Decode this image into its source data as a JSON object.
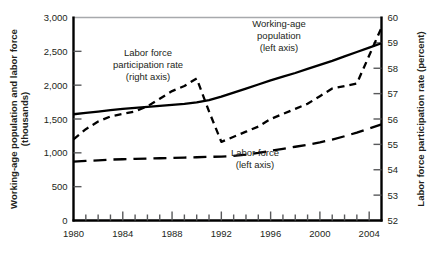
{
  "chart_data": {
    "type": "line",
    "title": "",
    "xlabel": "",
    "ylabel": "Working-age population and labor force (thousands)",
    "y2label": "Labor force participation rate (percent)",
    "x": [
      1980,
      1981,
      1982,
      1983,
      1984,
      1985,
      1986,
      1987,
      1988,
      1989,
      1990,
      1991,
      1992,
      1993,
      1994,
      1995,
      1996,
      1997,
      1998,
      1999,
      2000,
      2001,
      2002,
      2003,
      2004,
      2005
    ],
    "xlim": [
      1980,
      2005
    ],
    "xticks": [
      1980,
      1981,
      1982,
      1983,
      1984,
      1985,
      1986,
      1987,
      1988,
      1989,
      1990,
      1991,
      1992,
      1993,
      1994,
      1995,
      1996,
      1997,
      1998,
      1999,
      2000,
      2001,
      2002,
      2003,
      2004,
      2005
    ],
    "xtick_labels": [
      "1980",
      "",
      "",
      "",
      "1984",
      "",
      "",
      "",
      "1988",
      "",
      "",
      "",
      "1992",
      "",
      "",
      "",
      "1996",
      "",
      "",
      "",
      "2000",
      "",
      "",
      "",
      "2004",
      ""
    ],
    "ylim": [
      0,
      3000
    ],
    "yticks": [
      0,
      500,
      1000,
      1500,
      2000,
      2500,
      3000
    ],
    "ytick_labels": [
      "0",
      "500",
      "1,000",
      "1,500",
      "2,000",
      "2,500",
      "3,000"
    ],
    "y2lim": [
      52,
      60
    ],
    "y2ticks": [
      52,
      53,
      54,
      55,
      56,
      57,
      58,
      59,
      60
    ],
    "y2tick_labels": [
      "52",
      "53",
      "54",
      "55",
      "56",
      "57",
      "58",
      "59",
      "60"
    ],
    "grid": false,
    "legend_position": "inline-annotations",
    "series": [
      {
        "name": "Working-age population (left axis)",
        "axis": "left",
        "style": "solid",
        "color": "#000000",
        "values": [
          1570,
          1590,
          1610,
          1630,
          1650,
          1665,
          1680,
          1695,
          1710,
          1725,
          1745,
          1780,
          1830,
          1890,
          1950,
          2010,
          2070,
          2125,
          2180,
          2240,
          2300,
          2360,
          2425,
          2490,
          2555,
          2620
        ]
      },
      {
        "name": "Labor force (left axis)",
        "axis": "left",
        "style": "long-dash",
        "color": "#000000",
        "values": [
          870,
          880,
          890,
          900,
          905,
          910,
          915,
          920,
          925,
          930,
          935,
          940,
          945,
          955,
          975,
          1000,
          1030,
          1060,
          1090,
          1120,
          1155,
          1195,
          1245,
          1300,
          1360,
          1420
        ]
      },
      {
        "name": "Labor force participation rate (right axis)",
        "axis": "right",
        "style": "short-dash",
        "color": "#000000",
        "values": [
          55.2,
          55.6,
          55.9,
          56.1,
          56.2,
          56.3,
          56.5,
          56.8,
          57.1,
          57.3,
          57.6,
          56.3,
          55.1,
          55.3,
          55.5,
          55.7,
          56.0,
          56.2,
          56.4,
          56.6,
          56.9,
          57.2,
          57.3,
          57.4,
          58.5,
          59.6
        ]
      }
    ],
    "annotations": [
      {
        "name": "labor-force-participation-label",
        "lines": [
          "Labor force",
          "participation rate",
          "(right axis)"
        ]
      },
      {
        "name": "working-age-population-label",
        "lines": [
          "Working-age",
          "population",
          "(left axis)"
        ]
      },
      {
        "name": "labor-force-label",
        "lines": [
          "Labor force",
          "(left axis)"
        ]
      }
    ]
  }
}
